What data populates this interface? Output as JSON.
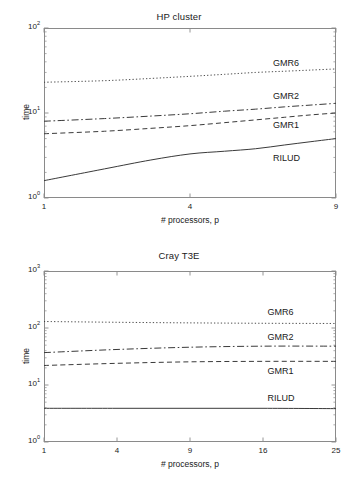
{
  "figure": {
    "background": "#ffffff",
    "line_color": "#3a3a3a",
    "axis_color": "#8a8a8a"
  },
  "charts": [
    {
      "title": "HP cluster",
      "xlabel": "# processors, p",
      "ylabel": "time",
      "xticks": [
        "1",
        "4",
        "9"
      ],
      "yticks": [
        "0",
        "1",
        "2"
      ],
      "series_labels": [
        "GMR6",
        "GMR2",
        "GMR1",
        "RILUD"
      ]
    },
    {
      "title": "Cray T3E",
      "xlabel": "# processors, p",
      "ylabel": "time",
      "xticks": [
        "1",
        "4",
        "9",
        "16",
        "25"
      ],
      "yticks": [
        "0",
        "1",
        "2",
        "3"
      ],
      "series_labels": [
        "GMR6",
        "GMR2",
        "GMR1",
        "RILUD"
      ]
    }
  ],
  "chart_data": [
    {
      "type": "line",
      "title": "HP cluster",
      "xlabel": "# processors, p",
      "ylabel": "time",
      "xscale": "sqrt",
      "yscale": "log",
      "xlim": [
        1,
        9
      ],
      "ylim": [
        1,
        100
      ],
      "xticks": [
        1,
        4,
        9
      ],
      "xticklabels": [
        "1",
        "4",
        "9"
      ],
      "yticks": [
        1,
        10,
        100
      ],
      "yticklabels": [
        "10^0",
        "10^1",
        "10^2"
      ],
      "grid": false,
      "legend": "inline-labels",
      "series": [
        {
          "name": "GMR6",
          "style": "dotted",
          "x": [
            1,
            2,
            3,
            4,
            5,
            6,
            7,
            8,
            9
          ],
          "y": [
            23.0,
            24.0,
            25.5,
            27.0,
            28.5,
            30.0,
            31.0,
            32.0,
            33.0
          ]
        },
        {
          "name": "GMR2",
          "style": "dashdot",
          "x": [
            1,
            2,
            3,
            4,
            5,
            6,
            7,
            8,
            9
          ],
          "y": [
            8.0,
            8.6,
            9.2,
            9.8,
            10.5,
            11.1,
            11.8,
            12.4,
            13.0
          ]
        },
        {
          "name": "GMR1",
          "style": "dashed",
          "x": [
            1,
            2,
            3,
            4,
            5,
            6,
            7,
            8,
            9
          ],
          "y": [
            5.7,
            6.1,
            6.6,
            7.1,
            7.7,
            8.3,
            8.9,
            9.5,
            10.0
          ]
        },
        {
          "name": "RILUD",
          "style": "solid",
          "x": [
            1,
            2,
            3,
            4,
            5,
            6,
            7,
            8,
            9
          ],
          "y": [
            1.6,
            2.2,
            2.8,
            3.3,
            3.55,
            3.8,
            4.2,
            4.6,
            5.0
          ]
        }
      ],
      "annotations": [
        {
          "text": "GMR6",
          "x": 6.6,
          "y": 38
        },
        {
          "text": "GMR2",
          "x": 6.6,
          "y": 15.5
        },
        {
          "text": "GMR1",
          "x": 6.6,
          "y": 7.0
        },
        {
          "text": "RILUD",
          "x": 6.6,
          "y": 2.9
        }
      ]
    },
    {
      "type": "line",
      "title": "Cray T3E",
      "xlabel": "# processors, p",
      "ylabel": "time",
      "xscale": "sqrt",
      "yscale": "log",
      "xlim": [
        1,
        25
      ],
      "ylim": [
        1,
        1000
      ],
      "xticks": [
        1,
        4,
        9,
        16,
        25
      ],
      "xticklabels": [
        "1",
        "4",
        "9",
        "16",
        "25"
      ],
      "yticks": [
        1,
        10,
        100,
        1000
      ],
      "yticklabels": [
        "10^0",
        "10^1",
        "10^2",
        "10^3"
      ],
      "grid": false,
      "legend": "inline-labels",
      "series": [
        {
          "name": "GMR6",
          "style": "dotted",
          "x": [
            1,
            4,
            9,
            16,
            25
          ],
          "y": [
            130,
            126,
            123,
            121,
            120
          ]
        },
        {
          "name": "GMR2",
          "style": "dashdot",
          "x": [
            1,
            4,
            9,
            16,
            25
          ],
          "y": [
            37,
            42,
            46,
            48,
            48
          ]
        },
        {
          "name": "GMR1",
          "style": "dashed",
          "x": [
            1,
            4,
            9,
            16,
            25
          ],
          "y": [
            22,
            24,
            25.5,
            26,
            26
          ]
        },
        {
          "name": "RILUD",
          "style": "solid",
          "x": [
            1,
            4,
            9,
            16,
            25
          ],
          "y": [
            3.9,
            3.9,
            3.9,
            3.9,
            3.85
          ]
        }
      ],
      "annotations": [
        {
          "text": "GMR6",
          "x": 16.5,
          "y": 185
        },
        {
          "text": "GMR2",
          "x": 16.5,
          "y": 68
        },
        {
          "text": "GMR1",
          "x": 16.5,
          "y": 17
        },
        {
          "text": "RILUD",
          "x": 16.5,
          "y": 5.6
        }
      ]
    }
  ]
}
